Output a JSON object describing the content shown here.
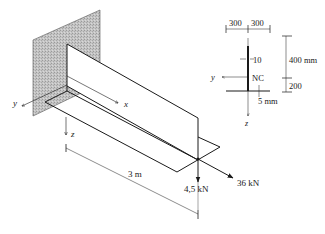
{
  "figure": {
    "type": "cantilever T-beam isometric diagram",
    "axes": {
      "x_label": "x",
      "y_label": "y",
      "z_label": "z"
    },
    "beam": {
      "length_label": "3 m"
    },
    "loads": [
      {
        "label": "4,5 kN",
        "direction": "downward (z)"
      },
      {
        "label": "36 kN",
        "direction": "axial (x)"
      }
    ],
    "cross_section": {
      "flange_left_label": "300",
      "flange_right_label": "300",
      "web_thickness_label": "10",
      "neutral_axis_label": "NC",
      "flange_thickness_label": "5 mm",
      "upper_height_label": "400 mm",
      "lower_height_label": "200",
      "y_label": "y",
      "z_label": "z"
    },
    "colors": {
      "line": "#1a1a1a",
      "wall_fill": "#bdbdbd"
    }
  }
}
